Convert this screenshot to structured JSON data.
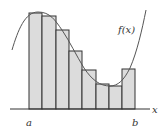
{
  "diagram": {
    "type": "riemann-sum",
    "function_label": "f(x)",
    "axis_label": "x",
    "interval_start_label": "a",
    "interval_end_label": "b",
    "rectangle_count": 8,
    "rectangles": [
      {
        "x0": 29,
        "x1": 42,
        "top": 13
      },
      {
        "x0": 42,
        "x1": 56,
        "top": 16
      },
      {
        "x0": 56,
        "x1": 69,
        "top": 30
      },
      {
        "x0": 69,
        "x1": 82,
        "top": 51
      },
      {
        "x0": 82,
        "x1": 96,
        "top": 70
      },
      {
        "x0": 96,
        "x1": 109,
        "top": 84
      },
      {
        "x0": 109,
        "x1": 122,
        "top": 86
      },
      {
        "x0": 122,
        "x1": 135,
        "top": 69
      }
    ],
    "colors": {
      "rect_fill": "#dcdcdc",
      "rect_stroke": "#333333",
      "curve": "#555555",
      "axis": "#333333"
    }
  }
}
